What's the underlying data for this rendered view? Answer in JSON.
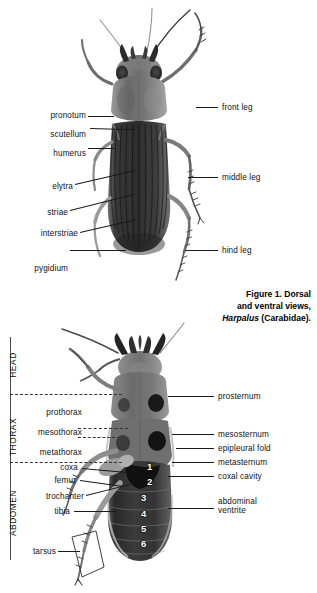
{
  "figure": {
    "caption_line1": "Figure 1. Dorsal",
    "caption_line2": "and ventral views,",
    "caption_genus": "Harpalus",
    "caption_family": " (Carabidae)."
  },
  "dorsal": {
    "left_labels": [
      {
        "name": "pronotum",
        "text": "pronotum"
      },
      {
        "name": "scutellum",
        "text": "scutellum"
      },
      {
        "name": "humerus",
        "text": "humerus"
      },
      {
        "name": "elytra",
        "text": "elytra"
      },
      {
        "name": "striae",
        "text": "striae"
      },
      {
        "name": "interstriae",
        "text": "interstriae"
      },
      {
        "name": "pygidium",
        "text": "pygidium"
      }
    ],
    "right_labels": [
      {
        "name": "front-leg",
        "text": "front leg"
      },
      {
        "name": "middle-leg",
        "text": "middle leg"
      },
      {
        "name": "hind-leg",
        "text": "hind leg"
      }
    ]
  },
  "ventral": {
    "regions": [
      {
        "name": "head",
        "text": "HEAD"
      },
      {
        "name": "thorax",
        "text": "THORAX"
      },
      {
        "name": "abdomen",
        "text": "ABDOMEN"
      }
    ],
    "left_labels": [
      {
        "name": "prothorax",
        "text": "prothorax"
      },
      {
        "name": "mesothorax",
        "text": "mesothorax"
      },
      {
        "name": "metathorax",
        "text": "metathorax"
      },
      {
        "name": "coxa",
        "text": "coxa"
      },
      {
        "name": "femur",
        "text": "femur"
      },
      {
        "name": "trochanter",
        "text": "trochanter"
      },
      {
        "name": "tibia",
        "text": "tibia"
      },
      {
        "name": "tarsus",
        "text": "tarsus"
      }
    ],
    "right_labels": [
      {
        "name": "prosternum",
        "text": "prosternum"
      },
      {
        "name": "mesosternum",
        "text": "mesosternum"
      },
      {
        "name": "epipleural-fold",
        "text": "epipleural fold"
      },
      {
        "name": "metasternum",
        "text": "metasternum"
      },
      {
        "name": "coxal-cavity",
        "text": "coxal cavity"
      },
      {
        "name": "abdominal-ventrite",
        "text": "abdominal ventrite"
      }
    ],
    "ventrite_numbers": [
      "1",
      "2",
      "3",
      "4",
      "5",
      "6"
    ]
  },
  "colors": {
    "ink": "#1a1a1a",
    "background": "#ffffff",
    "specimen_dark": "#2e2e2e",
    "specimen_mid": "#7d7d7d",
    "specimen_light": "#c9c9c9"
  }
}
